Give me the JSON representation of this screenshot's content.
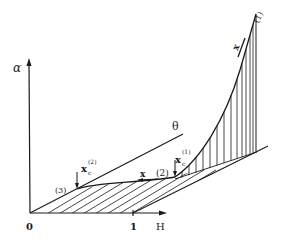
{
  "diagram": {
    "axes": {
      "vertical_label": "α",
      "horizontal_label": "H",
      "depth_label": "θ",
      "origin_label": "0",
      "unit_tick_label": "1"
    },
    "points": {
      "p1": "(1)",
      "p2": "(2)",
      "p3": "(3)"
    },
    "annotations": {
      "xc1_main": "x",
      "xc1_sub": "c",
      "xc1_sup": "(1)",
      "xc2_main": "x",
      "xc2_sub": "c",
      "xc2_sup": "(2)",
      "x_arrow_low": "x",
      "x_arrow_high": "x"
    },
    "colors": {
      "ink": "#1a1a1a",
      "background": "#ffffff"
    }
  }
}
